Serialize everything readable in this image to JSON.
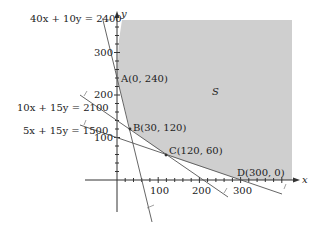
{
  "diagram": {
    "type": "feasible-region",
    "axes": {
      "x_label": "x",
      "y_label": "y",
      "x_ticks": [
        "100",
        "200",
        "300"
      ],
      "y_ticks": [
        "100",
        "200",
        "300"
      ]
    },
    "region_label": "S",
    "region_color": "#cfcfcf",
    "constraints": [
      {
        "id": "c1",
        "label": "40x + 10y = 2400"
      },
      {
        "id": "c2",
        "label": "10x + 15y = 2100"
      },
      {
        "id": "c3",
        "label": "5x + 15y = 1500"
      }
    ],
    "vertices": [
      {
        "id": "A",
        "label": "A(0, 240)",
        "x": 0,
        "y": 240
      },
      {
        "id": "B",
        "label": "B(30, 120)",
        "x": 30,
        "y": 120
      },
      {
        "id": "C",
        "label": "C(120, 60)",
        "x": 120,
        "y": 60
      },
      {
        "id": "D",
        "label": "D(300, 0)",
        "x": 300,
        "y": 0
      }
    ]
  }
}
